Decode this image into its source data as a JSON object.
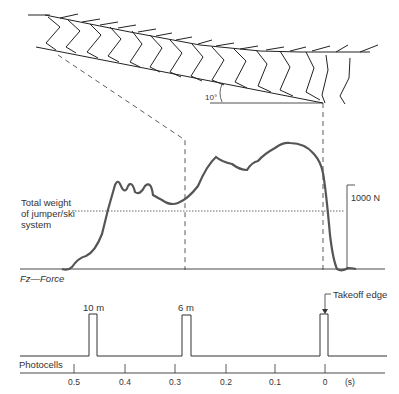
{
  "diagram": {
    "hill": {
      "angle_label": "10°"
    },
    "force_panel": {
      "axis_label": "Fz—Force",
      "weight_label": [
        "Total weight",
        "of jumper/ski",
        "system"
      ],
      "scale_label": "1000 N"
    },
    "photocell_panel": {
      "axis_label": "Photocells",
      "pulse_labels": [
        "10 m",
        "6 m"
      ],
      "takeoff_label": "Takeoff edge"
    },
    "time_axis": {
      "ticks": [
        "0.5",
        "0.4",
        "0.3",
        "0.2",
        "0.1",
        "0"
      ],
      "unit": "(s)"
    },
    "colors": {
      "force_curve": "#555555",
      "lines": "#333333"
    }
  }
}
